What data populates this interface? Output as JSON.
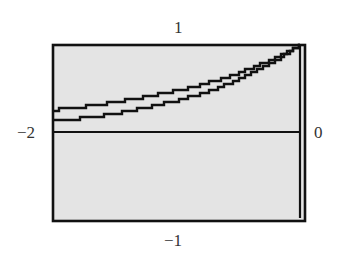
{
  "chart_data": {
    "type": "line",
    "title": "",
    "xlabel": "",
    "ylabel": "",
    "xlim": [
      -2,
      0
    ],
    "ylim": [
      -1,
      1
    ],
    "grid": false,
    "window_labels": {
      "ymax": "1",
      "ymin": "−1",
      "xmin": "−2",
      "xmax": "0"
    },
    "x": [
      -2.0,
      -1.75,
      -1.5,
      -1.25,
      -1.0,
      -0.75,
      -0.5,
      -0.25,
      0.0
    ],
    "series": [
      {
        "name": "upper curve",
        "values": [
          0.26,
          0.3,
          0.35,
          0.41,
          0.48,
          0.57,
          0.68,
          0.82,
          1.0
        ]
      },
      {
        "name": "lower curve",
        "values": [
          0.135,
          0.17,
          0.22,
          0.29,
          0.37,
          0.47,
          0.61,
          0.78,
          1.0
        ]
      }
    ],
    "axes": {
      "x_axis_at_y": 0,
      "y_axis_at_x": 0
    },
    "background_color": "#e6e6e6",
    "line_color": "#111111"
  }
}
